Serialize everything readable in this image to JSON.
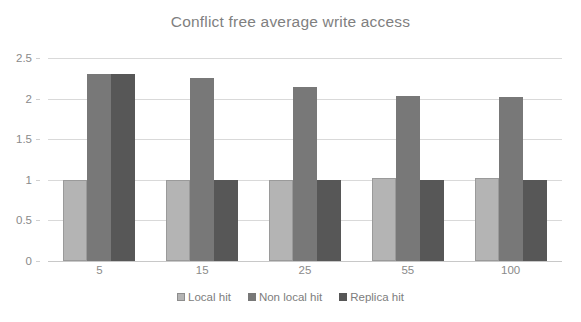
{
  "chart_data": {
    "type": "bar",
    "title": "Conflict free average write access",
    "xlabel": "",
    "ylabel": "",
    "categories": [
      "5",
      "15",
      "25",
      "55",
      "100"
    ],
    "series": [
      {
        "name": "Local hit",
        "color": "#b4b4b4",
        "values": [
          1.0,
          1.0,
          1.0,
          1.02,
          1.02
        ]
      },
      {
        "name": "Non local hit",
        "color": "#787878",
        "values": [
          2.3,
          2.25,
          2.14,
          2.03,
          2.02
        ]
      },
      {
        "name": "Replica hit",
        "color": "#575757",
        "values": [
          2.3,
          1.0,
          1.0,
          1.0,
          1.0
        ]
      }
    ],
    "ylim": [
      0,
      2.5
    ],
    "yticks": [
      "0",
      "0.5",
      "1",
      "1.5",
      "2",
      "2.5"
    ],
    "ytick_values": [
      0,
      0.5,
      1,
      1.5,
      2,
      2.5
    ],
    "grid": true,
    "legend_position": "bottom"
  },
  "colors": {
    "title": "#7f7f7f",
    "axis_text": "#8a8a8a",
    "gridline": "#d9d9d9",
    "background": "#ffffff"
  }
}
